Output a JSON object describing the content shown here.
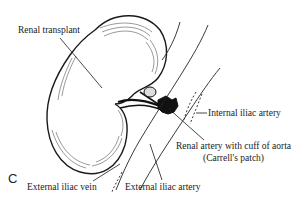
{
  "figure": {
    "panel_letter": "C",
    "labels": {
      "renal_transplant": "Renal transplant",
      "internal_iliac_artery": "Internal iliac artery",
      "renal_artery_line1": "Renal artery with cuff of aorta",
      "renal_artery_line2": "(Carrell's patch)",
      "external_iliac_vein": "External iliac vein",
      "external_iliac_artery": "External iliac artery"
    },
    "colors": {
      "ink": "#1a1a1a",
      "background": "#ffffff"
    }
  }
}
